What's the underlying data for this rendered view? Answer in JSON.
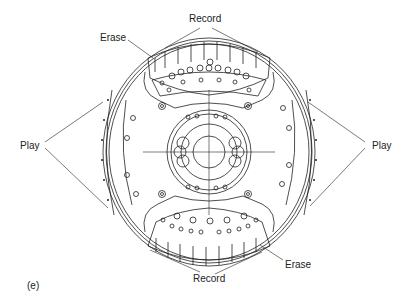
{
  "labels": {
    "record_top": "Record",
    "erase_top": "Erase",
    "play_left": "Play",
    "play_right": "Play",
    "record_bottom": "Record",
    "erase_bottom": "Erase",
    "panel": "(e)"
  },
  "colors": {
    "line": "#222222",
    "background": "#ffffff"
  }
}
